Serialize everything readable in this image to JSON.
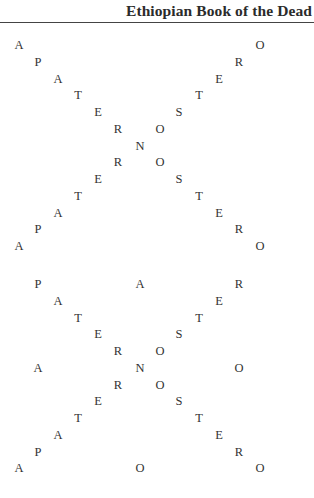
{
  "header": {
    "running_title": "Ethiopian Book of the Dead"
  },
  "columns_x": [
    19,
    38,
    58,
    78,
    98,
    118,
    140,
    160,
    179,
    199,
    219,
    239,
    260
  ],
  "blocks": [
    {
      "name": "paternoster-cross-1",
      "top": 38,
      "row_step": 16.75,
      "rows": [
        [
          {
            "ch": "A",
            "col": 0
          },
          {
            "ch": "O",
            "col": 12
          }
        ],
        [
          {
            "ch": "P",
            "col": 1
          },
          {
            "ch": "R",
            "col": 11
          }
        ],
        [
          {
            "ch": "A",
            "col": 2
          },
          {
            "ch": "E",
            "col": 10
          }
        ],
        [
          {
            "ch": "T",
            "col": 3
          },
          {
            "ch": "T",
            "col": 9
          }
        ],
        [
          {
            "ch": "E",
            "col": 4
          },
          {
            "ch": "S",
            "col": 8
          }
        ],
        [
          {
            "ch": "R",
            "col": 5
          },
          {
            "ch": "O",
            "col": 7
          }
        ],
        [
          {
            "ch": "N",
            "col": 6
          }
        ],
        [
          {
            "ch": "R",
            "col": 5
          },
          {
            "ch": "O",
            "col": 7
          }
        ],
        [
          {
            "ch": "E",
            "col": 4
          },
          {
            "ch": "S",
            "col": 8
          }
        ],
        [
          {
            "ch": "T",
            "col": 3
          },
          {
            "ch": "T",
            "col": 9
          }
        ],
        [
          {
            "ch": "A",
            "col": 2
          },
          {
            "ch": "E",
            "col": 10
          }
        ],
        [
          {
            "ch": "P",
            "col": 1
          },
          {
            "ch": "R",
            "col": 11
          }
        ],
        [
          {
            "ch": "A",
            "col": 0
          },
          {
            "ch": "O",
            "col": 12
          }
        ]
      ]
    },
    {
      "name": "paternoster-cross-2",
      "top": 277,
      "row_step": 16.75,
      "rows": [
        [
          {
            "ch": "P",
            "col": 1
          },
          {
            "ch": "A",
            "col": 6
          },
          {
            "ch": "R",
            "col": 11
          }
        ],
        [
          {
            "ch": "A",
            "col": 2
          },
          {
            "ch": "E",
            "col": 10
          }
        ],
        [
          {
            "ch": "T",
            "col": 3
          },
          {
            "ch": "T",
            "col": 9
          }
        ],
        [
          {
            "ch": "E",
            "col": 4
          },
          {
            "ch": "S",
            "col": 8
          }
        ],
        [
          {
            "ch": "R",
            "col": 5
          },
          {
            "ch": "O",
            "col": 7
          }
        ],
        [
          {
            "ch": "A",
            "col": 1
          },
          {
            "ch": "N",
            "col": 6
          },
          {
            "ch": "O",
            "col": 11
          }
        ],
        [
          {
            "ch": "R",
            "col": 5
          },
          {
            "ch": "O",
            "col": 7
          }
        ],
        [
          {
            "ch": "E",
            "col": 4
          },
          {
            "ch": "S",
            "col": 8
          }
        ],
        [
          {
            "ch": "T",
            "col": 3
          },
          {
            "ch": "T",
            "col": 9
          }
        ],
        [
          {
            "ch": "A",
            "col": 2
          },
          {
            "ch": "E",
            "col": 10
          }
        ],
        [
          {
            "ch": "P",
            "col": 1
          },
          {
            "ch": "R",
            "col": 11
          }
        ],
        [
          {
            "ch": "A",
            "col": 0
          },
          {
            "ch": "O",
            "col": 6
          },
          {
            "ch": "O",
            "col": 12
          }
        ]
      ]
    }
  ]
}
